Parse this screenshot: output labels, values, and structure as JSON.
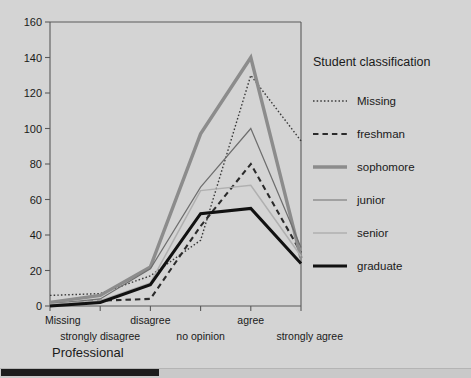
{
  "chart_data": {
    "type": "line",
    "title": "",
    "xlabel": "Professional",
    "ylabel": "",
    "ylim": [
      0,
      160
    ],
    "ytick_step": 20,
    "yticks": [
      "0",
      "20",
      "40",
      "60",
      "80",
      "100",
      "120",
      "140",
      "160"
    ],
    "categories": [
      "Missing",
      "strongly disagree",
      "disagree",
      "no opinion",
      "agree",
      "strongly agree"
    ],
    "grid": false,
    "legend_position": "right",
    "legend_title": "Student classification",
    "series": [
      {
        "name": "Missing",
        "style": "dotted",
        "color": "#3a3a3a",
        "width": 1.4,
        "values": [
          6,
          7,
          17,
          37,
          130,
          93
        ]
      },
      {
        "name": "freshman",
        "style": "dashed",
        "color": "#2b2b2b",
        "width": 2.1,
        "values": [
          1,
          3,
          4,
          45,
          80,
          30
        ]
      },
      {
        "name": "sophomore",
        "style": "solid",
        "color": "#8c8c8c",
        "width": 3.4,
        "values": [
          2,
          6,
          22,
          97,
          140,
          27
        ]
      },
      {
        "name": "junior",
        "style": "solid",
        "color": "#6e6e6e",
        "width": 1.2,
        "values": [
          1,
          4,
          21,
          67,
          100,
          33
        ]
      },
      {
        "name": "senior",
        "style": "solid",
        "color": "#b0b0b0",
        "width": 1.5,
        "values": [
          1,
          3,
          13,
          65,
          68,
          28
        ]
      },
      {
        "name": "graduate",
        "style": "solid",
        "color": "#111111",
        "width": 3.0,
        "values": [
          0,
          2,
          12,
          52,
          55,
          24
        ]
      }
    ]
  },
  "axis_titles": {
    "x": "Professional"
  },
  "legend": {
    "title": "Student classification",
    "entries": [
      "Missing",
      "freshman",
      "sophomore",
      "junior",
      "senior",
      "graduate"
    ]
  },
  "scrollbar": {
    "orientation": "horizontal",
    "position": "bottom"
  }
}
